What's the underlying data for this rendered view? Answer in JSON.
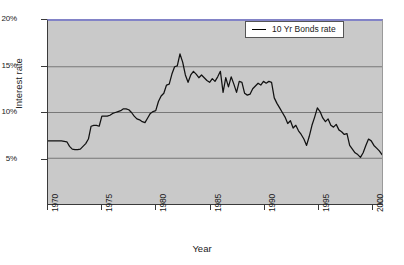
{
  "chart_data": {
    "type": "line",
    "title": "",
    "xlabel": "Year",
    "ylabel": "Interest rate",
    "xlim": [
      1970,
      2001
    ],
    "ylim": [
      0,
      20
    ],
    "grid": true,
    "legend_position": "top-right",
    "x_ticks": [
      "1970",
      "1975",
      "1980",
      "1985",
      "1990",
      "1995",
      "2000"
    ],
    "x_tick_values": [
      1970,
      1975,
      1980,
      1985,
      1990,
      1995,
      2000
    ],
    "y_ticks": [
      "5%",
      "10%",
      "15%",
      "20%"
    ],
    "y_tick_values": [
      5,
      10,
      15,
      20
    ],
    "series": [
      {
        "name": "10 Yr Bonds rate",
        "color": "#111111",
        "x": [
          1970.0,
          1970.25,
          1970.5,
          1970.75,
          1971.0,
          1971.25,
          1971.5,
          1971.75,
          1972.0,
          1972.25,
          1972.5,
          1972.75,
          1973.0,
          1973.25,
          1973.5,
          1973.75,
          1974.0,
          1974.25,
          1974.5,
          1974.75,
          1975.0,
          1975.25,
          1975.5,
          1975.75,
          1976.0,
          1976.25,
          1976.5,
          1976.75,
          1977.0,
          1977.25,
          1977.5,
          1977.75,
          1978.0,
          1978.25,
          1978.5,
          1978.75,
          1979.0,
          1979.25,
          1979.5,
          1979.75,
          1980.0,
          1980.25,
          1980.5,
          1980.75,
          1981.0,
          1981.25,
          1981.5,
          1981.75,
          1982.0,
          1982.25,
          1982.5,
          1982.75,
          1983.0,
          1983.25,
          1983.5,
          1983.75,
          1984.0,
          1984.25,
          1984.5,
          1984.75,
          1985.0,
          1985.25,
          1985.5,
          1985.75,
          1986.0,
          1986.25,
          1986.5,
          1986.75,
          1987.0,
          1987.25,
          1987.5,
          1987.75,
          1988.0,
          1988.25,
          1988.5,
          1988.75,
          1989.0,
          1989.25,
          1989.5,
          1989.75,
          1990.0,
          1990.25,
          1990.5,
          1990.75,
          1991.0,
          1991.25,
          1991.5,
          1991.75,
          1992.0,
          1992.25,
          1992.5,
          1992.75,
          1993.0,
          1993.25,
          1993.5,
          1993.75,
          1994.0,
          1994.25,
          1994.5,
          1994.75,
          1995.0,
          1995.25,
          1995.5,
          1995.75,
          1996.0,
          1996.25,
          1996.5,
          1996.75,
          1997.0,
          1997.25,
          1997.5,
          1997.75,
          1998.0,
          1998.25,
          1998.5,
          1998.75,
          1999.0,
          1999.25,
          1999.5,
          1999.75,
          2000.0,
          2000.25,
          2000.5,
          2000.75,
          2001.0
        ],
        "values": [
          6.9,
          6.9,
          6.9,
          6.9,
          6.9,
          6.9,
          6.85,
          6.8,
          6.3,
          6.0,
          5.95,
          5.95,
          6.0,
          6.3,
          6.6,
          7.1,
          8.5,
          8.6,
          8.6,
          8.5,
          9.6,
          9.6,
          9.6,
          9.7,
          9.9,
          10.0,
          10.1,
          10.2,
          10.4,
          10.4,
          10.3,
          10.0,
          9.6,
          9.3,
          9.2,
          9.0,
          8.9,
          9.4,
          9.9,
          10.1,
          10.2,
          11.2,
          11.8,
          12.1,
          13.0,
          13.1,
          14.2,
          15.0,
          15.1,
          16.4,
          15.5,
          14.1,
          13.3,
          14.1,
          14.5,
          14.2,
          13.8,
          14.1,
          13.8,
          13.5,
          13.3,
          13.7,
          13.4,
          13.9,
          14.5,
          12.2,
          13.8,
          12.8,
          13.9,
          13.1,
          12.2,
          13.4,
          13.3,
          12.1,
          11.9,
          12.0,
          12.6,
          12.9,
          13.2,
          13.0,
          13.4,
          13.2,
          13.4,
          13.3,
          11.6,
          11.0,
          10.5,
          10.0,
          9.5,
          8.8,
          9.1,
          8.3,
          8.6,
          8.0,
          7.6,
          7.1,
          6.4,
          7.4,
          8.6,
          9.5,
          10.5,
          10.1,
          9.4,
          9.0,
          9.3,
          8.6,
          8.4,
          8.7,
          8.1,
          7.9,
          7.6,
          7.7,
          6.4,
          6.0,
          5.6,
          5.4,
          5.1,
          5.6,
          6.4,
          7.1,
          6.9,
          6.4,
          6.1,
          5.8,
          5.4
        ],
        "min": 5.1,
        "max": 16.4,
        "min_year": 1999,
        "max_year": 1982.25
      }
    ]
  },
  "legend": {
    "entries": [
      {
        "label": "10 Yr Bonds rate",
        "color": "#111111"
      }
    ]
  },
  "axes": {
    "x_title": "Year",
    "y_title": "Interest rate"
  },
  "colors": {
    "plot_background": "#c9c9c9",
    "page_background": "#ffffff",
    "gridline": "#6e6e6e",
    "axis_line": "#3a3a3a",
    "top_border": "#8283c7",
    "series_line": "#111111"
  }
}
